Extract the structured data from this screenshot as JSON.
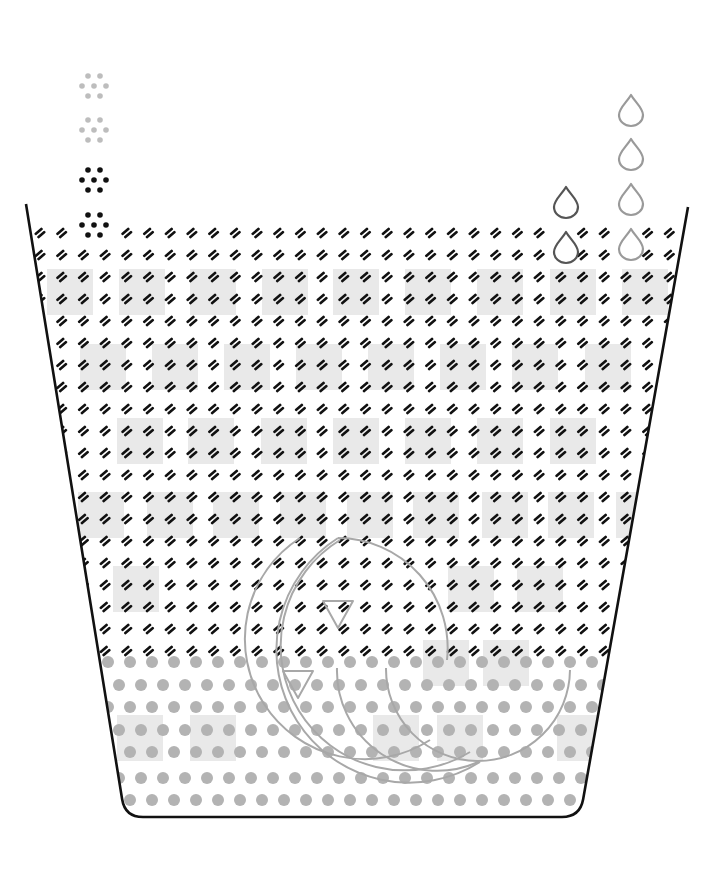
{
  "diagram": {
    "canvas": {
      "width": 711,
      "height": 888,
      "background": "#ffffff"
    },
    "colors": {
      "container_stroke": "#111111",
      "dash_glyph": "#111111",
      "shaded_square": "#e9e9e9",
      "bottom_dot": "#b3b3b3",
      "arc_stroke": "#a8a8a8",
      "triangle_stroke": "#a8a8a8",
      "dark_particle": "#111111",
      "light_particle": "#bdbdbd",
      "dark_drop": "#555555",
      "light_drop": "#9a9a9a"
    },
    "container": {
      "shape": "trapezoid-beaker",
      "top_left": [
        26,
        204
      ],
      "top_right": [
        688,
        207
      ],
      "bottom_left": [
        125,
        817
      ],
      "bottom_right": [
        580,
        817
      ]
    },
    "dash_grid": {
      "glyph": "double-dash",
      "rows_y": [
        233,
        255,
        277,
        299,
        321,
        343,
        365,
        387,
        409,
        431,
        453,
        475,
        497,
        519,
        541,
        563,
        585,
        607,
        629,
        651
      ],
      "pitch_x": 21.7
    },
    "shaded_squares": {
      "size": 46,
      "rows": [
        {
          "y": 269,
          "x": [
            47,
            119,
            190,
            262,
            333,
            405,
            477,
            550,
            622
          ]
        },
        {
          "y": 344,
          "x": [
            80,
            152,
            224,
            296,
            368,
            440,
            512,
            585
          ]
        },
        {
          "y": 418,
          "x": [
            117,
            188,
            261,
            333,
            405,
            477,
            550
          ]
        },
        {
          "y": 492,
          "x": [
            78,
            147,
            213,
            280,
            347,
            413,
            482,
            548,
            616
          ]
        },
        {
          "y": 566,
          "x": [
            113,
            448,
            517
          ]
        },
        {
          "y": 640,
          "x": [
            423,
            483
          ]
        },
        {
          "y": 715,
          "x": [
            117,
            190,
            373,
            437,
            557
          ]
        }
      ]
    },
    "bottom_dots": {
      "rows_y": [
        662,
        685,
        707,
        730,
        752,
        778,
        800
      ],
      "pitch_x": 22,
      "radius": 6
    },
    "arcs": [
      {
        "name": "large-arc-1",
        "cx": 255,
        "cy": 648,
        "r": 113
      },
      {
        "name": "large-arc-2",
        "cx": 295,
        "cy": 650,
        "r": 113
      },
      {
        "name": "large-arc-3",
        "cx": 338,
        "cy": 648,
        "r": 110
      },
      {
        "name": "lower-arc-1",
        "start": [
          337,
          668
        ],
        "end": [
          470,
          762
        ]
      },
      {
        "name": "lower-arc-2",
        "start": [
          386,
          668
        ],
        "end": [
          570,
          670
        ]
      }
    ],
    "triangles": [
      {
        "name": "triangle-upper",
        "cx": 338,
        "top": 601,
        "size": 30
      },
      {
        "name": "triangle-lower",
        "cx": 298,
        "top": 671,
        "size": 30
      }
    ],
    "particle_clusters": [
      {
        "name": "particle-cluster-1",
        "cx": 94,
        "cy": 86,
        "tone": "light"
      },
      {
        "name": "particle-cluster-2",
        "cx": 94,
        "cy": 130,
        "tone": "light"
      },
      {
        "name": "particle-cluster-3",
        "cx": 94,
        "cy": 180,
        "tone": "dark"
      },
      {
        "name": "particle-cluster-4",
        "cx": 94,
        "cy": 225,
        "tone": "dark"
      }
    ],
    "drops": [
      {
        "name": "drop-dark-1",
        "cx": 566,
        "top": 187,
        "tone": "dark"
      },
      {
        "name": "drop-dark-2",
        "cx": 566,
        "top": 232,
        "tone": "dark"
      },
      {
        "name": "drop-light-1",
        "cx": 631,
        "top": 95,
        "tone": "light"
      },
      {
        "name": "drop-light-2",
        "cx": 631,
        "top": 139,
        "tone": "light"
      },
      {
        "name": "drop-light-3",
        "cx": 631,
        "top": 184,
        "tone": "light"
      },
      {
        "name": "drop-light-4",
        "cx": 631,
        "top": 229,
        "tone": "light"
      }
    ]
  }
}
